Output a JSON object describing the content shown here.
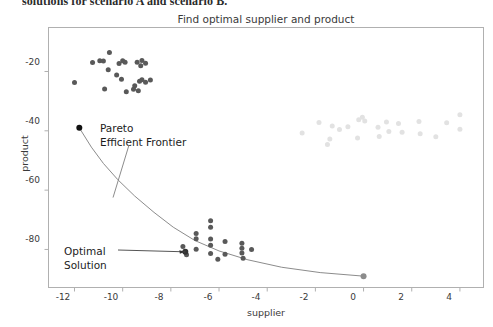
{
  "bleed": {
    "text": "solutions for scenario A and scenario B."
  },
  "figure": {
    "title": "Find optimal supplier and product",
    "xlabel": "supplier",
    "ylabel": "product",
    "annotations": {
      "frontier_line1": "Pareto",
      "frontier_line2": "Efficient Frontier",
      "optimal_line1": "Optimal",
      "optimal_line2": "Solution"
    },
    "colors": {
      "dark_points": "#595959",
      "light_points": "#e2e2e2",
      "curve": "#8c8c8c",
      "frame": "#b0b0b0",
      "text": "#3a3a3a",
      "marker_black": "#111111"
    }
  },
  "chart_data": {
    "type": "scatter",
    "title": "Find optimal supplier and product",
    "xlabel": "supplier",
    "ylabel": "product",
    "xlim": [
      -13.1,
      5.0
    ],
    "ylim": [
      -93.0,
      -5.0
    ],
    "xticks": [
      -12,
      -10,
      -8,
      -6,
      -4,
      -2,
      0,
      2,
      4
    ],
    "yticks": [
      -20,
      -40,
      -60,
      -80
    ],
    "grid": false,
    "legend": "none",
    "series": [
      {
        "name": "scenario A cluster",
        "color": "#595959",
        "size": 5,
        "points": [
          [
            -10.55,
            -13.6
          ],
          [
            -11.25,
            -17.0
          ],
          [
            -10.95,
            -16.4
          ],
          [
            -10.8,
            -16.5
          ],
          [
            -10.15,
            -17.3
          ],
          [
            -10.0,
            -16.4
          ],
          [
            -9.9,
            -16.9
          ],
          [
            -10.6,
            -19.4
          ],
          [
            -10.25,
            -21.2
          ],
          [
            -10.05,
            -22.6
          ],
          [
            -12.0,
            -23.7
          ],
          [
            -10.75,
            -25.9
          ],
          [
            -9.85,
            -26.8
          ],
          [
            -9.5,
            -24.8
          ],
          [
            -9.3,
            -23.3
          ],
          [
            -9.2,
            -22.8
          ],
          [
            -9.05,
            -23.6
          ],
          [
            -8.85,
            -22.9
          ],
          [
            -9.4,
            -16.9
          ],
          [
            -9.2,
            -16.3
          ],
          [
            -9.05,
            -17.2
          ],
          [
            -9.25,
            -18.1
          ],
          [
            -9.55,
            -26.0
          ],
          [
            -9.35,
            -26.5
          ]
        ]
      },
      {
        "name": "scenario B cluster",
        "color": "#595959",
        "size": 5,
        "points": [
          [
            -6.35,
            -70.3
          ],
          [
            -6.35,
            -72.5
          ],
          [
            -6.95,
            -74.6
          ],
          [
            -6.95,
            -76.4
          ],
          [
            -6.35,
            -76.5
          ],
          [
            -6.35,
            -78.6
          ],
          [
            -5.75,
            -77.3
          ],
          [
            -5.05,
            -77.9
          ],
          [
            -5.05,
            -79.6
          ],
          [
            -7.5,
            -79.0
          ],
          [
            -6.95,
            -79.9
          ],
          [
            -6.35,
            -81.4
          ],
          [
            -5.75,
            -81.6
          ],
          [
            -5.05,
            -81.2
          ],
          [
            -4.65,
            -80.0
          ],
          [
            -7.35,
            -81.8
          ],
          [
            -6.05,
            -83.3
          ],
          [
            -5.0,
            -83.0
          ]
        ]
      },
      {
        "name": "dominated cloud",
        "color": "#e2e2e2",
        "size": 5,
        "points": [
          [
            -2.55,
            -40.7
          ],
          [
            -1.85,
            -37.2
          ],
          [
            -1.3,
            -38.4
          ],
          [
            -1.0,
            -39.6
          ],
          [
            -0.65,
            -38.6
          ],
          [
            -0.2,
            -36.3
          ],
          [
            -0.05,
            -35.4
          ],
          [
            0.05,
            -36.7
          ],
          [
            0.6,
            -38.8
          ],
          [
            0.95,
            -37.0
          ],
          [
            1.05,
            -40.2
          ],
          [
            1.45,
            -37.5
          ],
          [
            1.6,
            -40.5
          ],
          [
            2.3,
            -36.9
          ],
          [
            2.35,
            -41.0
          ],
          [
            3.0,
            -42.0
          ],
          [
            3.45,
            -37.3
          ],
          [
            4.0,
            -34.6
          ],
          [
            4.0,
            -39.5
          ],
          [
            -1.4,
            -42.8
          ],
          [
            -1.5,
            -44.6
          ],
          [
            -0.25,
            -42.4
          ],
          [
            0.65,
            -41.9
          ]
        ]
      }
    ],
    "frontier_curve": {
      "name": "Pareto Efficient Frontier",
      "color": "#8c8c8c",
      "endpoints": [
        [
          -11.8,
          -39.0
        ],
        [
          0.0,
          -89.0
        ]
      ],
      "path_points": [
        [
          -11.8,
          -39.0
        ],
        [
          -11.3,
          -45.5
        ],
        [
          -10.8,
          -51.0
        ],
        [
          -10.2,
          -56.5
        ],
        [
          -9.5,
          -62.0
        ],
        [
          -8.7,
          -67.5
        ],
        [
          -7.9,
          -72.5
        ],
        [
          -7.0,
          -77.0
        ],
        [
          -6.0,
          -80.5
        ],
        [
          -4.8,
          -83.5
        ],
        [
          -3.4,
          -86.0
        ],
        [
          -1.8,
          -87.8
        ],
        [
          0.0,
          -89.0
        ]
      ]
    },
    "markers": [
      {
        "name": "frontier-left-endpoint",
        "x": -11.8,
        "y": -39.0,
        "color": "#111111"
      },
      {
        "name": "frontier-right-endpoint",
        "x": 0.0,
        "y": -89.0,
        "color": "#8c8c8c"
      },
      {
        "name": "optimal-solution-point",
        "x": -7.4,
        "y": -80.8,
        "color": "#333333"
      }
    ],
    "annotations": [
      {
        "name": "pareto-efficient-frontier",
        "text": "Pareto Efficient Frontier",
        "text_xy": [
          -10.0,
          -46.0
        ],
        "arrow_to": [
          -10.4,
          -62.5
        ]
      },
      {
        "name": "optimal-solution",
        "text": "Optimal Solution",
        "text_xy": [
          -11.4,
          -80.0
        ],
        "arrow_to": [
          -7.4,
          -80.8
        ]
      }
    ]
  }
}
